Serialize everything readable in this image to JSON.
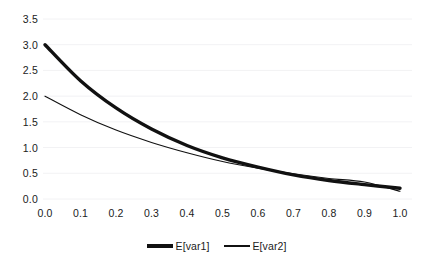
{
  "chart_data": {
    "type": "line",
    "title": "",
    "xlabel": "",
    "ylabel": "",
    "xlim": [
      0.0,
      1.0
    ],
    "ylim": [
      0.0,
      3.5
    ],
    "grid": true,
    "grid_axis": "y",
    "legend_position": "bottom",
    "background_color": "#ffffff",
    "line_color": "#111111",
    "grid_color": "#f2f2f4",
    "x": [
      0.0,
      0.1,
      0.2,
      0.3,
      0.4,
      0.5,
      0.6,
      0.7,
      0.8,
      0.9,
      1.0
    ],
    "series": [
      {
        "name": "E[var1]",
        "line_style": "solid",
        "line_width": 3.4,
        "values": [
          3.0,
          2.3,
          1.77,
          1.36,
          1.04,
          0.8,
          0.62,
          0.47,
          0.36,
          0.28,
          0.21
        ]
      },
      {
        "name": "E[var2]",
        "line_style": "solid",
        "line_width": 1.1,
        "values": [
          2.0,
          1.64,
          1.34,
          1.1,
          0.9,
          0.73,
          0.6,
          0.49,
          0.4,
          0.33,
          0.15
        ]
      }
    ],
    "yticks": [
      0.0,
      0.5,
      1.0,
      1.5,
      2.0,
      2.5,
      3.0,
      3.5
    ],
    "ytick_labels": [
      "0.0",
      "0.5",
      "1.0",
      "1.5",
      "2.0",
      "2.5",
      "3.0",
      "3.5"
    ],
    "xticks": [
      0.0,
      0.1,
      0.2,
      0.3,
      0.4,
      0.5,
      0.6,
      0.7,
      0.8,
      0.9,
      1.0
    ],
    "xtick_labels": [
      "0.0",
      "0.1",
      "0.2",
      "0.3",
      "0.4",
      "0.5",
      "0.6",
      "0.7",
      "0.8",
      "0.9",
      "1.0"
    ],
    "legend": [
      {
        "label": "E[var1]",
        "style": "thick"
      },
      {
        "label": "E[var2]",
        "style": "thin"
      }
    ]
  }
}
